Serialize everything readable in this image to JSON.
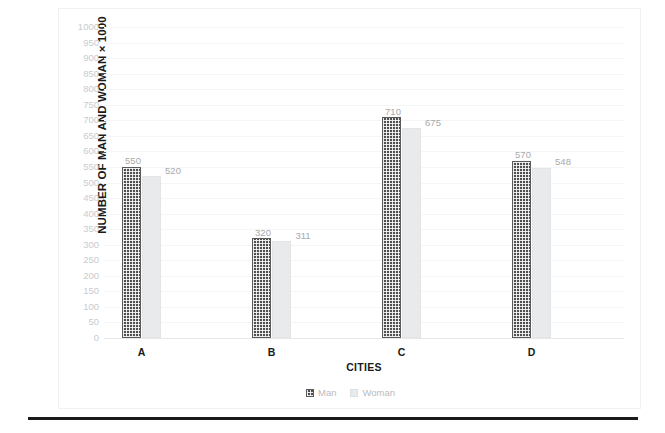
{
  "chart_data": {
    "type": "bar",
    "title": "",
    "xlabel": "CITIES",
    "ylabel": "NUMBER OF MAN AND WOMAN × 1000",
    "categories": [
      "A",
      "B",
      "C",
      "D"
    ],
    "series": [
      {
        "name": "Man",
        "values": [
          550,
          320,
          710,
          570
        ],
        "color": "#4f4f4f",
        "pattern": "checkered"
      },
      {
        "name": "Woman",
        "values": [
          520,
          311,
          675,
          548
        ],
        "color": "#e9eaeb",
        "pattern": "solid"
      }
    ],
    "ylim": [
      0,
      1000
    ],
    "ytick_step": 50,
    "yticks": [
      1000,
      950,
      900,
      850,
      800,
      750,
      700,
      650,
      600,
      550,
      500,
      450,
      400,
      350,
      300,
      250,
      200,
      150,
      100,
      50,
      0
    ],
    "grid": true,
    "legend_position": "bottom",
    "data_labels": true
  },
  "legend": {
    "items": [
      {
        "label": "Man"
      },
      {
        "label": "Woman"
      }
    ]
  }
}
